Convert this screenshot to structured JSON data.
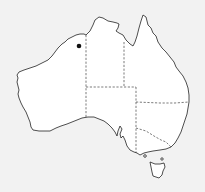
{
  "map": {
    "region": "Australia",
    "style": "outline map with state borders",
    "colors": {
      "background": "#f2f2f2",
      "land": "#ffffff",
      "coastline": "#222222",
      "state_borders": "#444444",
      "marker": "#111111"
    },
    "states": [
      "Western Australia",
      "Northern Territory",
      "Queensland",
      "South Australia",
      "New South Wales",
      "Victoria",
      "Tasmania"
    ],
    "markers": [
      {
        "id": "location-dot",
        "label": "",
        "x": 79,
        "y": 46,
        "region": "Western Australia (Kimberley)"
      }
    ]
  }
}
